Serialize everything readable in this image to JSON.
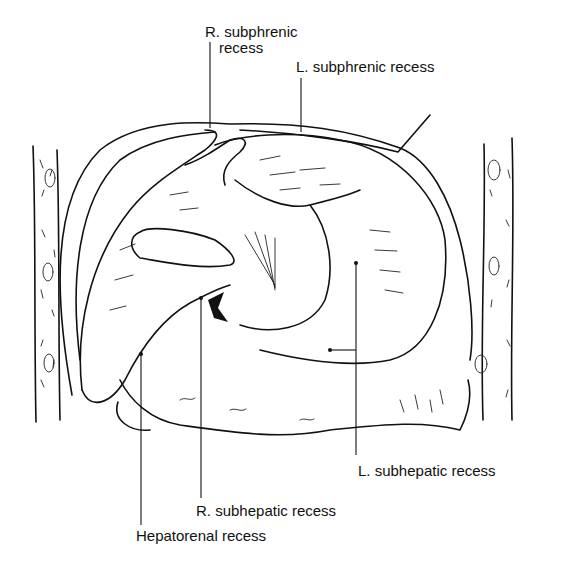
{
  "figure": {
    "labels": [
      {
        "id": "r-subphrenic",
        "line1": "R. subphrenic",
        "line2": "recess"
      },
      {
        "id": "l-subphrenic",
        "line1": "L. subphrenic recess"
      },
      {
        "id": "l-subhepatic",
        "line1": "L. subhepatic recess"
      },
      {
        "id": "r-subhepatic",
        "line1": "R. subhepatic recess"
      },
      {
        "id": "hepatorenal",
        "line1": "Hepatorenal recess"
      }
    ]
  }
}
